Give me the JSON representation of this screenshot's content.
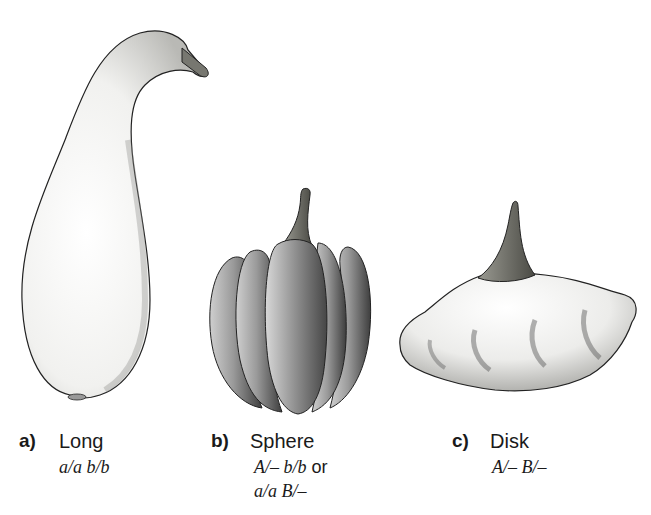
{
  "figure": {
    "panels": [
      {
        "letter": "a)",
        "name": "Long",
        "genotype_line1": "a/a b/b",
        "genotype_line2": "",
        "shape": "long-gourd"
      },
      {
        "letter": "b)",
        "name": "Sphere",
        "genotype_line1_part1": "A/– b/b",
        "genotype_line1_or": " or",
        "genotype_line2": "a/a B/–",
        "shape": "spherical-ribbed-squash"
      },
      {
        "letter": "c)",
        "name": "Disk",
        "genotype_line1": "A/– B/–",
        "genotype_line2": "",
        "shape": "disk-scalloped-squash"
      }
    ],
    "colors": {
      "outline": "#222222",
      "long_fill": "#f4f4f2",
      "sphere_fill": "#8a8a8a",
      "disk_fill": "#e6e6e2",
      "stem": "#6a6a64"
    }
  }
}
